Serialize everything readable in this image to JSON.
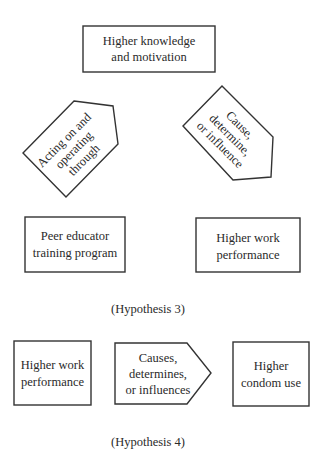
{
  "hypothesis3": {
    "top_box": {
      "line1": "Higher knowledge",
      "line2": "and motivation"
    },
    "left_arrow": {
      "line1": "Acting on and",
      "line2": "operating",
      "line3": "through"
    },
    "right_arrow": {
      "line1": "Cause,",
      "line2": "determine,",
      "line3": "or influence"
    },
    "bottom_left_box": {
      "line1": "Peer educator",
      "line2": "training program"
    },
    "bottom_right_box": {
      "line1": "Higher work",
      "line2": "performance"
    },
    "caption": "(Hypothesis 3)"
  },
  "hypothesis4": {
    "left_box": {
      "line1": "Higher work",
      "line2": "performance"
    },
    "arrow": {
      "line1": "Causes,",
      "line2": "determines,",
      "line3": "or influences"
    },
    "right_box": {
      "line1": "Higher",
      "line2": "condom use"
    },
    "caption": "(Hypothesis 4)"
  }
}
